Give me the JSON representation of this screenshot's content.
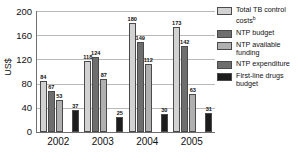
{
  "chart_data": {
    "type": "bar",
    "title": "",
    "xlabel": "",
    "ylabel": "US$",
    "ylim": [
      0,
      200
    ],
    "yticks": [
      200,
      160,
      120,
      80,
      40,
      0
    ],
    "grid": true,
    "legend_position": "right",
    "categories": [
      "2002",
      "2003",
      "2004",
      "2005"
    ],
    "series": [
      {
        "name": "Total TB control costs",
        "footnote": "b",
        "color": "#d2d2d2",
        "values": [
          84,
          118,
          180,
          173
        ]
      },
      {
        "name": "NTP budget",
        "footnote": "",
        "color": "#6e6e6e",
        "values": [
          67,
          124,
          149,
          142
        ]
      },
      {
        "name": "NTP available funding",
        "footnote": "",
        "color": "#b0b0b0",
        "values": [
          53,
          87,
          112,
          63
        ]
      },
      {
        "name": "NTP expenditure",
        "footnote": "",
        "color": "#6e6e6e",
        "values": [
          null,
          null,
          null,
          null
        ]
      },
      {
        "name": "First-line drugs budget",
        "footnote": "",
        "color": "#1c1c1c",
        "values": [
          37,
          25,
          30,
          31
        ]
      }
    ]
  },
  "legend": {
    "items": [
      {
        "label": "Total TB control costs",
        "sup": "b"
      },
      {
        "label": "NTP budget",
        "sup": ""
      },
      {
        "label": "NTP available funding",
        "sup": ""
      },
      {
        "label": "NTP expenditure",
        "sup": ""
      },
      {
        "label": "First-line drugs budget",
        "sup": ""
      }
    ]
  }
}
